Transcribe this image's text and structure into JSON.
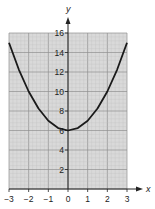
{
  "chart_data": {
    "type": "line",
    "title": "",
    "xlabel": "x",
    "ylabel": "y",
    "xlim": [
      -3,
      3
    ],
    "ylim": [
      0,
      16
    ],
    "grid": true,
    "legend": null,
    "x_ticks": [
      -3,
      -2,
      -1,
      0,
      1,
      2,
      3
    ],
    "x_tick_labels": [
      "−3",
      "−2",
      "−1",
      "0",
      "1",
      "2",
      "3"
    ],
    "y_ticks": [
      2,
      4,
      6,
      8,
      10,
      12,
      14,
      16
    ],
    "y_tick_labels": [
      "2",
      "4",
      "6",
      "8",
      "10",
      "12",
      "14",
      "16"
    ],
    "series": [
      {
        "name": "y = x² + 6",
        "x": [
          -3,
          -2.5,
          -2,
          -1.5,
          -1,
          -0.5,
          0,
          0.5,
          1,
          1.5,
          2,
          2.5,
          3
        ],
        "values": [
          15,
          12.25,
          10,
          8.25,
          7,
          6.25,
          6,
          6.25,
          7,
          8.25,
          10,
          12.25,
          15
        ]
      }
    ]
  },
  "colors": {
    "grid_bg": "#d9d9d9",
    "grid_minor": "#bdbdbd",
    "grid_major": "#8f8f8f",
    "axis": "#222222",
    "curve": "#1a1a1a"
  }
}
